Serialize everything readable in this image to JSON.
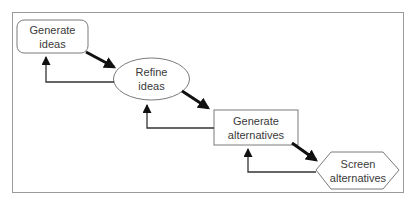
{
  "diagram": {
    "type": "flowchart",
    "nodes": [
      {
        "id": "generate-ideas",
        "shape": "rounded-rectangle",
        "label": "Generate\nideas"
      },
      {
        "id": "refine-ideas",
        "shape": "ellipse",
        "label": "Refine\nideas"
      },
      {
        "id": "generate-alternatives",
        "shape": "rectangle",
        "label": "Generate\nalternatives"
      },
      {
        "id": "screen-alternatives",
        "shape": "hexagon",
        "label": "Screen\nalternatives"
      }
    ],
    "edges": [
      {
        "from": "generate-ideas",
        "to": "refine-ideas",
        "style": "thick-forward"
      },
      {
        "from": "refine-ideas",
        "to": "generate-ideas",
        "style": "thin-feedback"
      },
      {
        "from": "refine-ideas",
        "to": "generate-alternatives",
        "style": "thick-forward"
      },
      {
        "from": "generate-alternatives",
        "to": "refine-ideas",
        "style": "thin-feedback"
      },
      {
        "from": "generate-alternatives",
        "to": "screen-alternatives",
        "style": "thick-forward"
      },
      {
        "from": "screen-alternatives",
        "to": "generate-alternatives",
        "style": "thin-feedback"
      }
    ],
    "colors": {
      "stroke": "#7a7a7a",
      "arrow": "#111111",
      "frame": "#9a9a9a",
      "text": "#3a3a3a",
      "background": "#ffffff"
    }
  }
}
